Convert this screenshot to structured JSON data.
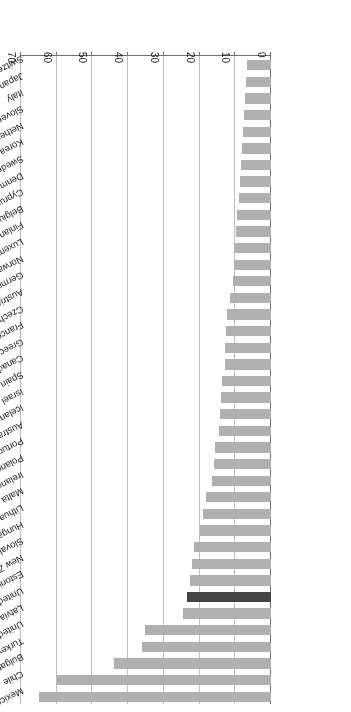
{
  "chart_data": {
    "type": "bar",
    "orientation": "horizontal",
    "title": "",
    "subtitle": "",
    "xlabel": "",
    "ylabel": "",
    "xlim": [
      0,
      70
    ],
    "xticks": [
      "0",
      "10",
      "20",
      "30",
      "40",
      "50",
      "60",
      "70"
    ],
    "grid": true,
    "legend": "none",
    "rotated_180": true,
    "colors": {
      "bar": "#b0b0b0",
      "highlight_bar": "#444444",
      "gridline": "#bdbdbd",
      "axis": "#6e6e6e",
      "text": "#1a1a1a",
      "background": "#ffffff"
    },
    "highlight_category": "United Kingdom",
    "categories": [
      "Mexico",
      "Chile",
      "Bulgaria",
      "Turkey",
      "United States",
      "Latvia",
      "United Kingdom",
      "Estonia",
      "New Zealand",
      "Slovak Republic",
      "Hungary",
      "Lithuania",
      "Malta",
      "Ireland",
      "Poland",
      "Portugal",
      "Australia",
      "Iceland",
      "Israel",
      "Spain",
      "Canada",
      "Greece",
      "France",
      "Czech Republic",
      "Austria",
      "Germany",
      "Norway",
      "Luxembourg",
      "Finland",
      "Belgium",
      "Cyprus",
      "Denmark",
      "Sweden",
      "Korea",
      "Netherlands",
      "Slovenia",
      "Italy",
      "Japan",
      "Switzerland"
    ],
    "values": [
      65.0,
      59.8,
      44.0,
      36.2,
      35.4,
      24.5,
      23.5,
      22.7,
      22.1,
      21.6,
      20.0,
      19.1,
      18.3,
      16.6,
      16.0,
      15.8,
      14.6,
      14.3,
      13.9,
      13.7,
      12.9,
      12.8,
      12.5,
      12.3,
      11.4,
      10.6,
      10.3,
      10.1,
      9.8,
      9.4,
      8.9,
      8.7,
      8.4,
      8.2,
      7.8,
      7.6,
      7.3,
      7.0,
      6.6
    ]
  }
}
